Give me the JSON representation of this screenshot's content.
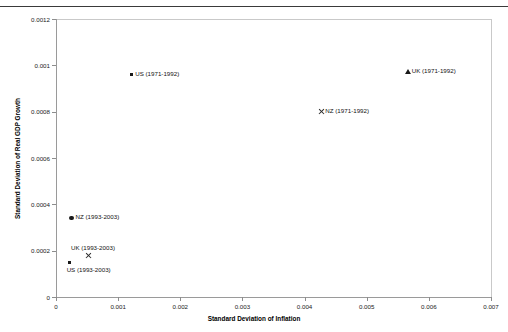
{
  "chart_data": {
    "type": "scatter",
    "title": "",
    "xlabel": "Standard Deviation of Inflation",
    "ylabel": "Standard Deviation of Real GDP Growth",
    "xlim": [
      0,
      0.007
    ],
    "ylim": [
      0,
      0.0012
    ],
    "xticks": [
      "0",
      "0.001",
      "0.002",
      "0.003",
      "0.004",
      "0.005",
      "0.006",
      "0.007"
    ],
    "xtick_values": [
      0,
      0.001,
      0.002,
      0.003,
      0.004,
      0.005,
      0.006,
      0.007
    ],
    "yticks": [
      "0",
      "0.0002",
      "0.0004",
      "0.0006",
      "0.0008",
      "0.001",
      "0.0012"
    ],
    "ytick_values": [
      0,
      0.0002,
      0.0004,
      0.0006,
      0.0008,
      0.001,
      0.0012
    ],
    "grid": false,
    "legend": "none",
    "points": [
      {
        "label": "US (1971-1992)",
        "x": 0.00121,
        "y": 0.00096,
        "marker": "square",
        "label_position": "right"
      },
      {
        "label": "UK (1971-1992)",
        "label_short": "UK (1971-1992)",
        "x": 0.00566,
        "y": 0.00097,
        "marker": "triangle",
        "label_position": "right"
      },
      {
        "label": "NZ (1971-1992)",
        "x": 0.00427,
        "y": 0.0008,
        "marker": "cross",
        "label_position": "right"
      },
      {
        "label": "NZ (1993-2003)",
        "x": 0.00025,
        "y": 0.00034,
        "marker": "circle",
        "label_position": "right"
      },
      {
        "label": "UK (1993-2003)",
        "x": 0.00053,
        "y": 0.00018,
        "marker": "cross",
        "label_position": "above"
      },
      {
        "label": "US (1993-2003)",
        "x": 0.00022,
        "y": 0.00015,
        "marker": "square",
        "label_position": "below"
      }
    ]
  }
}
